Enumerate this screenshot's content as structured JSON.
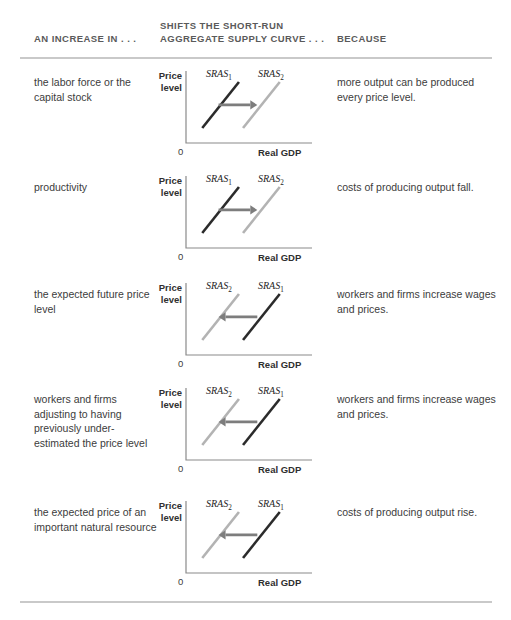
{
  "header": {
    "col1": "AN INCREASE IN . . .",
    "col2": "SHIFTS THE SHORT-RUN AGGREGATE SUPPLY CURVE . . .",
    "col3": "BECAUSE"
  },
  "colors": {
    "curve_dark": "#2b2b2b",
    "curve_light": "#b3b3b3",
    "arrow": "#7d7d7d",
    "axis": "#8a8a8a",
    "rule": "#c9c9c9",
    "header_text": "#5a5a5a",
    "body_text": "#3c3c3c"
  },
  "diagram_labels": {
    "y_axis": "Price level",
    "x_axis": "Real GDP",
    "origin": "0",
    "sras1": "SRAS",
    "sras1_sub": "1",
    "sras2": "SRAS",
    "sras2_sub": "2"
  },
  "rows": [
    {
      "cause": "the labor force or the capital stock",
      "because": "more output can be produced every price level.",
      "shift": "right",
      "left_curve": "SRAS1",
      "right_curve": "SRAS2",
      "left_label": "SRAS",
      "left_sub": "1",
      "right_label": "SRAS",
      "right_sub": "2"
    },
    {
      "cause": "productivity",
      "because": "costs of producing output fall.",
      "shift": "right",
      "left_curve": "SRAS1",
      "right_curve": "SRAS2",
      "left_label": "SRAS",
      "left_sub": "1",
      "right_label": "SRAS",
      "right_sub": "2"
    },
    {
      "cause": "the expected future price level",
      "because": "workers and firms increase wages and prices.",
      "shift": "left",
      "left_curve": "SRAS2",
      "right_curve": "SRAS1",
      "left_label": "SRAS",
      "left_sub": "2",
      "right_label": "SRAS",
      "right_sub": "1"
    },
    {
      "cause": "workers and firms adjusting to having previously under-estimated the price level",
      "because": "workers and firms increase wages and prices.",
      "shift": "left",
      "left_curve": "SRAS2",
      "right_curve": "SRAS1",
      "left_label": "SRAS",
      "left_sub": "2",
      "right_label": "SRAS",
      "right_sub": "1"
    },
    {
      "cause": "the expected price of an important natural resource",
      "because": "costs of producing output rise.",
      "shift": "left",
      "left_curve": "SRAS2",
      "right_curve": "SRAS1",
      "left_label": "SRAS",
      "left_sub": "2",
      "right_label": "SRAS",
      "right_sub": "1"
    }
  ],
  "chart_data": {
    "type": "line",
    "xlabel": "Real GDP",
    "ylabel": "Price level",
    "origin_label": "0",
    "grid": false,
    "legend": "inline-curve-labels",
    "panels": [
      {
        "row": 1,
        "shift_direction": "right",
        "series": [
          {
            "name": "SRAS1",
            "color": "#2b2b2b",
            "x": [
              12,
              48
            ],
            "y": [
              12,
              62
            ]
          },
          {
            "name": "SRAS2",
            "color": "#b3b3b3",
            "x": [
              52,
              88
            ],
            "y": [
              12,
              62
            ]
          }
        ],
        "arrow": {
          "from_x": 28,
          "to_x": 66,
          "y": 37,
          "color": "#7d7d7d"
        }
      },
      {
        "row": 2,
        "shift_direction": "right",
        "series": [
          {
            "name": "SRAS1",
            "color": "#2b2b2b",
            "x": [
              12,
              48
            ],
            "y": [
              12,
              62
            ]
          },
          {
            "name": "SRAS2",
            "color": "#b3b3b3",
            "x": [
              52,
              88
            ],
            "y": [
              12,
              62
            ]
          }
        ],
        "arrow": {
          "from_x": 28,
          "to_x": 66,
          "y": 37,
          "color": "#7d7d7d"
        }
      },
      {
        "row": 3,
        "shift_direction": "left",
        "series": [
          {
            "name": "SRAS2",
            "color": "#b3b3b3",
            "x": [
              12,
              48
            ],
            "y": [
              12,
              62
            ]
          },
          {
            "name": "SRAS1",
            "color": "#2b2b2b",
            "x": [
              52,
              88
            ],
            "y": [
              12,
              62
            ]
          }
        ],
        "arrow": {
          "from_x": 66,
          "to_x": 28,
          "y": 37,
          "color": "#7d7d7d"
        }
      },
      {
        "row": 4,
        "shift_direction": "left",
        "series": [
          {
            "name": "SRAS2",
            "color": "#b3b3b3",
            "x": [
              12,
              48
            ],
            "y": [
              12,
              62
            ]
          },
          {
            "name": "SRAS1",
            "color": "#2b2b2b",
            "x": [
              52,
              88
            ],
            "y": [
              12,
              62
            ]
          }
        ],
        "arrow": {
          "from_x": 66,
          "to_x": 28,
          "y": 37,
          "color": "#7d7d7d"
        }
      },
      {
        "row": 5,
        "shift_direction": "left",
        "series": [
          {
            "name": "SRAS2",
            "color": "#b3b3b3",
            "x": [
              12,
              48
            ],
            "y": [
              12,
              62
            ]
          },
          {
            "name": "SRAS1",
            "color": "#2b2b2b",
            "x": [
              52,
              88
            ],
            "y": [
              12,
              62
            ]
          }
        ],
        "arrow": {
          "from_x": 66,
          "to_x": 28,
          "y": 37,
          "color": "#7d7d7d"
        }
      }
    ]
  },
  "layout": {
    "row_tops": [
      75,
      180,
      287,
      392,
      505
    ]
  }
}
